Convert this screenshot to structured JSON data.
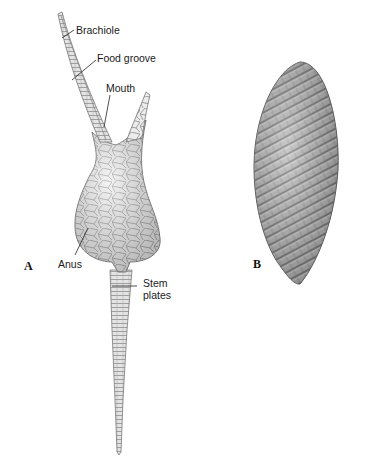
{
  "figure": {
    "panel_a": {
      "letter": "A",
      "subject": "echinoderm with brachioles and stem",
      "labels": {
        "brachiole": "Brachiole",
        "food_groove": "Food groove",
        "mouth": "Mouth",
        "anus": "Anus",
        "stem_plates_line1": "Stem",
        "stem_plates_line2": "plates"
      }
    },
    "panel_b": {
      "letter": "B",
      "subject": "spindle-shaped body with spiral plate rows"
    },
    "colors": {
      "background": "#ffffff",
      "plate_fill": "#e6e6e6",
      "plate_outline": "#8a8a8a",
      "spiral_fill": "#9a9a9a",
      "label_text": "#1a1a1a"
    }
  }
}
